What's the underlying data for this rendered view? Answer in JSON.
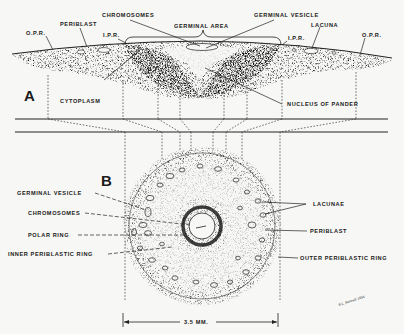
{
  "figure": {
    "section_a": {
      "letter": "A",
      "labels": {
        "opr_left": "O.P.R.",
        "periblast": "PERIBLAST",
        "ipr_left": "I.P.R.",
        "chromosomes": "CHROMOSOMES",
        "germinal_area": "GERMINAL AREA",
        "germinal_vesicle": "GERMINAL VESICLE",
        "ipr_right": "I.P.R.",
        "lacuna": "LACUNA",
        "opr_right": "O.P.R.",
        "cytoplasm": "CYTOPLASM",
        "nucleus_of_pander": "NUCLEUS OF PANDER"
      }
    },
    "section_b": {
      "letter": "B",
      "labels": {
        "germinal_vesicle": "GERMINAL VESICLE",
        "chromosomes": "CHROMOSOMES",
        "polar_ring": "POLAR RING",
        "inner_periblastic_ring": "INNER PERIBLASTIC RING",
        "lacunae": "LACUNAE",
        "periblast": "PERIBLAST",
        "outer_periblastic_ring": "OUTER PERIBLASTIC RING"
      }
    },
    "scale": "3.5 MM.",
    "signature": "B.L. Bennett 1934"
  }
}
